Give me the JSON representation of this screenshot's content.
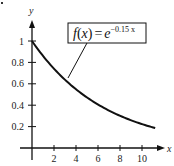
{
  "chart_data": {
    "type": "line",
    "title": "",
    "function_label": {
      "prefix": "f",
      "open": "(",
      "var": "x",
      "close": ")",
      "equals": "=",
      "base": "e",
      "exponent": "−0.15 x",
      "full": "f(x) = e^(−0.15x)"
    },
    "xlabel": "x",
    "ylabel": "y",
    "xlim": [
      0,
      12
    ],
    "ylim": [
      0,
      1.1
    ],
    "x_ticks": [
      2,
      4,
      6,
      8,
      10
    ],
    "x_tick_labels": [
      "2",
      "4",
      "6",
      "8",
      "10"
    ],
    "y_ticks": [
      0.2,
      0.4,
      0.6,
      0.8,
      1
    ],
    "y_tick_labels": [
      "0.2",
      "0.4",
      "0.6",
      "0.8",
      "1"
    ],
    "grid": false,
    "legend": "callout box pointing to curve",
    "series": [
      {
        "name": "f(x) = e^(-0.15x)",
        "x": [
          0,
          1,
          2,
          3,
          4,
          5,
          6,
          7,
          8,
          9,
          10,
          11.2
        ],
        "values": [
          1.0,
          0.86,
          0.74,
          0.64,
          0.55,
          0.47,
          0.41,
          0.35,
          0.3,
          0.26,
          0.22,
          0.19
        ]
      }
    ],
    "colors": {
      "curve": "#111111",
      "axes": "#111111",
      "background": "#ffffff"
    }
  }
}
